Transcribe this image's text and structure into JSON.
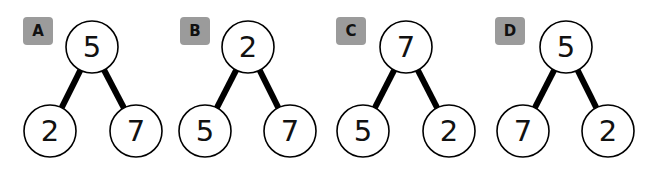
{
  "options": [
    {
      "label": "A",
      "badge_x": 23,
      "root": {
        "value": "5",
        "cx": 92,
        "cy": 47
      },
      "left": {
        "value": "2",
        "cx": 50,
        "cy": 131
      },
      "right": {
        "value": "7",
        "cx": 136,
        "cy": 131
      }
    },
    {
      "label": "B",
      "badge_x": 180,
      "root": {
        "value": "2",
        "cx": 248,
        "cy": 47
      },
      "left": {
        "value": "5",
        "cx": 205,
        "cy": 131
      },
      "right": {
        "value": "7",
        "cx": 290,
        "cy": 131
      }
    },
    {
      "label": "C",
      "badge_x": 336,
      "root": {
        "value": "7",
        "cx": 406,
        "cy": 47
      },
      "left": {
        "value": "5",
        "cx": 363,
        "cy": 131
      },
      "right": {
        "value": "2",
        "cx": 449,
        "cy": 131
      }
    },
    {
      "label": "D",
      "badge_x": 495,
      "root": {
        "value": "5",
        "cx": 566,
        "cy": 47
      },
      "left": {
        "value": "7",
        "cx": 523,
        "cy": 131
      },
      "right": {
        "value": "2",
        "cx": 608,
        "cy": 131
      }
    }
  ],
  "style": {
    "badge_color": "#9b9b9b",
    "edge_color": "#000000",
    "node_fill": "#ffffff"
  }
}
